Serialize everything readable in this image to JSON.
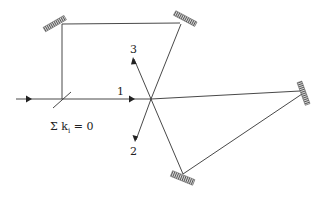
{
  "diagram": {
    "labels": {
      "beam1": "1",
      "beam2": "2",
      "beam3": "3",
      "condition_prefix": "Σ k",
      "condition_sub": "i",
      "condition_suffix": " = 0"
    },
    "colors": {
      "line": "#333333",
      "mirror": "#555555",
      "background": "#ffffff"
    },
    "elements": {
      "mirrors": [
        "top-left-mirror",
        "top-right-mirror",
        "right-mirror",
        "bottom-mirror"
      ],
      "beam_splitter": "beam-splitter",
      "crossing_point": [
        151,
        99
      ]
    }
  }
}
